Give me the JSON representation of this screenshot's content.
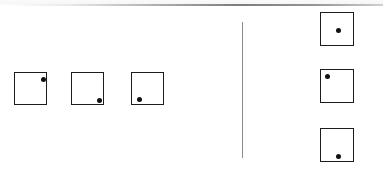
{
  "figure": {
    "background_color": "#ffffff",
    "stroke_color": "#1c1c1c",
    "dot_color": "#111111",
    "divider_color": "#8a8a8a",
    "width": 383,
    "height": 169
  },
  "page_edge": {
    "label": "scanned page top edge",
    "y": 4
  },
  "divider": {
    "label": "vertical separator line",
    "x": 242,
    "top": 22,
    "bottom": 158
  },
  "left_group": {
    "label": "left row of squares",
    "squares": [
      {
        "name": "square-1",
        "dot_position": "top-right",
        "x": 14,
        "y": 72,
        "size": 33,
        "dot_x": 26,
        "dot_y": 4
      },
      {
        "name": "square-2",
        "dot_position": "bottom-right",
        "x": 71,
        "y": 72,
        "size": 33,
        "dot_x": 25,
        "dot_y": 25
      },
      {
        "name": "square-3",
        "dot_position": "bottom-left",
        "x": 131,
        "y": 72,
        "size": 33,
        "dot_x": 5,
        "dot_y": 24
      }
    ]
  },
  "right_group": {
    "label": "right column of squares",
    "squares": [
      {
        "name": "square-4",
        "dot_position": "center",
        "x": 320,
        "y": 12,
        "size": 34,
        "dot_x": 15,
        "dot_y": 15
      },
      {
        "name": "square-5",
        "dot_position": "top-left",
        "x": 320,
        "y": 69,
        "size": 34,
        "dot_x": 4,
        "dot_y": 4
      },
      {
        "name": "square-6",
        "dot_position": "bottom-center",
        "x": 320,
        "y": 128,
        "size": 34,
        "dot_x": 15,
        "dot_y": 25
      }
    ]
  }
}
